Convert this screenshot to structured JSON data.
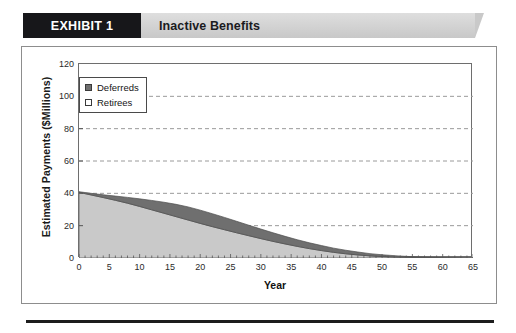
{
  "banner": {
    "tab_label": "EXHIBIT 1",
    "title": "Inactive Benefits"
  },
  "chart_data": {
    "type": "area",
    "stacked": true,
    "title": "Inactive Benefits",
    "xlabel": "Year",
    "ylabel": "Estimated Payments ($Millions)",
    "xlim": [
      0,
      65
    ],
    "ylim": [
      0,
      120
    ],
    "xticks": [
      0,
      5,
      10,
      15,
      20,
      25,
      30,
      35,
      40,
      45,
      50,
      55,
      60,
      65
    ],
    "yticks": [
      0,
      20,
      40,
      60,
      80,
      100,
      120
    ],
    "grid": "horizontal-dashed",
    "legend_position": "top-left",
    "x": [
      0,
      2,
      4,
      6,
      8,
      10,
      12,
      14,
      16,
      18,
      20,
      22,
      24,
      26,
      28,
      30,
      32,
      34,
      36,
      38,
      40,
      42,
      44,
      46,
      48,
      50,
      52,
      54,
      56,
      58,
      60,
      62,
      65
    ],
    "series": [
      {
        "name": "Retirees",
        "color": "#c9c9c9",
        "values": [
          40.6,
          39.0,
          37.4,
          35.7,
          33.9,
          31.9,
          29.8,
          27.7,
          25.6,
          23.5,
          21.4,
          19.4,
          17.5,
          15.6,
          13.8,
          12.0,
          10.3,
          8.7,
          7.2,
          5.8,
          4.6,
          3.5,
          2.6,
          1.9,
          1.3,
          0.9,
          0.6,
          0.4,
          0.25,
          0.15,
          0.08,
          0.04,
          0.0
        ]
      },
      {
        "name": "Deferreds",
        "color": "#6f6f6f",
        "values": [
          0.4,
          1.0,
          1.7,
          2.6,
          3.6,
          4.7,
          5.8,
          6.8,
          7.6,
          8.1,
          8.2,
          8.0,
          7.6,
          7.1,
          6.5,
          5.9,
          5.3,
          4.7,
          4.1,
          3.6,
          3.1,
          2.6,
          2.2,
          1.8,
          1.4,
          1.1,
          0.85,
          0.6,
          0.4,
          0.25,
          0.12,
          0.05,
          0.0
        ]
      }
    ],
    "totals": [
      41.0,
      40.0,
      39.1,
      38.3,
      37.5,
      36.6,
      35.6,
      34.5,
      33.2,
      31.6,
      29.6,
      27.4,
      25.1,
      22.7,
      20.3,
      17.9,
      15.6,
      13.4,
      11.3,
      9.4,
      7.7,
      6.1,
      4.8,
      3.7,
      2.7,
      2.0,
      1.45,
      1.0,
      0.65,
      0.4,
      0.2,
      0.09,
      0.0
    ],
    "legend": [
      {
        "label": "Deferreds",
        "color": "#6f6f6f",
        "filled": true
      },
      {
        "label": "Retirees",
        "color": "#ffffff",
        "filled": false
      }
    ]
  }
}
